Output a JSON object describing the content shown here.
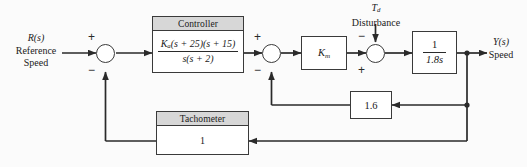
{
  "diagram": {
    "line_color": "#3a3a3a",
    "header_fill": "#d7d7d7",
    "background": "#fbfbfb",
    "input": {
      "symbol": "R(s)",
      "line1": "Reference",
      "line2": "Speed"
    },
    "output": {
      "symbol": "Y(s)",
      "line1": "Speed"
    },
    "disturbance": {
      "symbol_main": "T",
      "symbol_sub": "d",
      "label": "Disturbance"
    },
    "controller": {
      "header": "Controller",
      "numerator": "K_a(s + 25)(s + 15)",
      "num_gain": "K",
      "num_gain_sub": "a",
      "num_rest": "(s + 25)(s + 15)",
      "denominator": "s(s + 2)"
    },
    "motor": {
      "gain_main": "K",
      "gain_sub": "m"
    },
    "plant": {
      "numerator": "1",
      "denominator": "1.8s"
    },
    "inner_feedback": {
      "gain": "1.6"
    },
    "tachometer": {
      "header": "Tachometer",
      "gain": "1"
    },
    "summing_junctions": [
      {
        "name": "error-junction",
        "plus": "+",
        "minus": "−"
      },
      {
        "name": "inner-loop-junction",
        "plus": "+",
        "minus": "−"
      },
      {
        "name": "disturbance-junction",
        "plus": "+",
        "minus": "−"
      }
    ]
  }
}
